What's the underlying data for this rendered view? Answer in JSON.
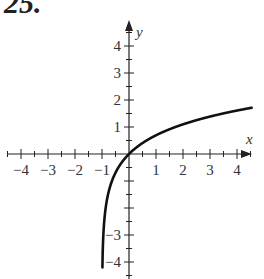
{
  "problem": {
    "number": "25."
  },
  "chart_data": {
    "type": "line",
    "title": "",
    "function": "y = ln(x + 1)",
    "xlabel": "x",
    "ylabel": "y",
    "xlim": [
      -4.5,
      4.5
    ],
    "ylim": [
      -4.4,
      4.6
    ],
    "grid": false,
    "x_tick_labels": [
      "-4",
      "-3",
      "-2",
      "-1",
      "1",
      "2",
      "3",
      "4"
    ],
    "y_tick_labels": [
      "4",
      "3",
      "2",
      "1",
      "-3",
      "-4"
    ],
    "minor_ticks": 0.5,
    "vertical_asymptote": -1,
    "series": [
      {
        "name": "curve",
        "x": [
          -0.985,
          -0.98,
          -0.95,
          -0.9,
          -0.8,
          -0.6,
          -0.4,
          -0.2,
          0,
          0.5,
          1,
          1.5,
          2,
          2.5,
          3,
          3.5,
          4,
          4.5
        ],
        "y": [
          -4.2,
          -3.91,
          -3.0,
          -2.3,
          -1.61,
          -0.92,
          -0.51,
          -0.22,
          0,
          0.41,
          0.69,
          0.92,
          1.1,
          1.25,
          1.39,
          1.5,
          1.61,
          1.7
        ]
      }
    ]
  }
}
